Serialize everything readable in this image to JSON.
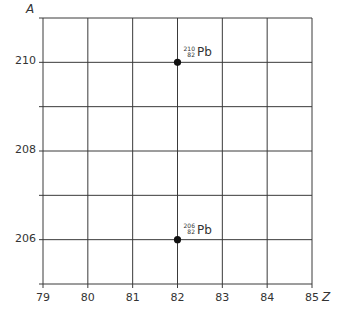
{
  "chart_data": {
    "type": "scatter",
    "title": "",
    "xlabel": "Z",
    "ylabel": "A",
    "xlim": [
      79,
      85
    ],
    "ylim": [
      205,
      211
    ],
    "x_ticks": [
      79,
      80,
      81,
      82,
      83,
      84,
      85
    ],
    "x_tick_labels": [
      "79",
      "80",
      "81",
      "82",
      "83",
      "84",
      "85"
    ],
    "y_ticks": [
      206,
      208,
      210
    ],
    "y_tick_labels": [
      "206",
      "208",
      "210"
    ],
    "grid": true,
    "grid_y_lines": [
      205,
      206,
      207,
      208,
      209,
      210,
      211
    ],
    "series": [
      {
        "name": "nuclides",
        "points": [
          {
            "x": 82,
            "y": 210,
            "label": "Pb",
            "mass": "210",
            "atomic": "82"
          },
          {
            "x": 82,
            "y": 206,
            "label": "Pb",
            "mass": "206",
            "atomic": "82"
          }
        ]
      }
    ],
    "legend": null
  },
  "colors": {
    "grid": "#3a3a3a",
    "point": "#111111",
    "text": "#333333"
  }
}
